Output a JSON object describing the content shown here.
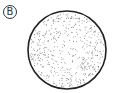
{
  "figure": {
    "label": "B",
    "shape": "circle",
    "fill": "stippled-dots",
    "stroke_color": "#222222",
    "dot_color": "#555555",
    "center": [
      67,
      50
    ],
    "radius": 39
  }
}
